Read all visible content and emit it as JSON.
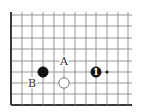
{
  "diagram": {
    "type": "go-board-fragment",
    "grid": {
      "columns_x": [
        11,
        22,
        32,
        43,
        54,
        64,
        75,
        86,
        96,
        107,
        118,
        128
      ],
      "rows_y": [
        15,
        26,
        38,
        49,
        61,
        72,
        83,
        94,
        105
      ],
      "right_extent": 132,
      "line_color": "#8a8a8a",
      "edge_color": "#3a3a3a",
      "left_edge": true,
      "bottom_edge": true
    },
    "stones": [
      {
        "color": "black",
        "col": 3,
        "row": 5,
        "label": ""
      },
      {
        "color": "white",
        "col": 5,
        "row": 6,
        "label": ""
      },
      {
        "color": "black",
        "col": 8,
        "row": 5,
        "label": "1"
      }
    ],
    "markers": [
      {
        "text": "A",
        "col": 5,
        "row": 4
      },
      {
        "text": "B",
        "col": 2,
        "row": 6
      }
    ],
    "star_points": [
      {
        "col": 9,
        "row": 5
      }
    ]
  }
}
